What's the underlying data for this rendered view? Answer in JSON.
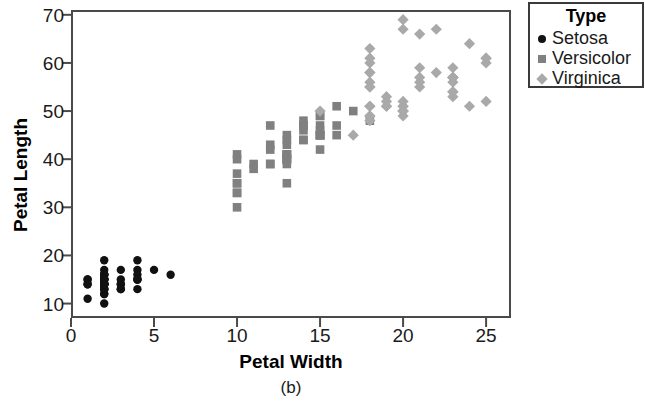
{
  "chart_data": {
    "type": "scatter",
    "title": "",
    "subcaption": "(b)",
    "xlabel": "Petal Width",
    "ylabel": "Petal Length",
    "xlim": [
      0,
      26.5
    ],
    "ylim": [
      7,
      71
    ],
    "xticks": [
      0,
      5,
      10,
      15,
      20,
      25
    ],
    "yticks": [
      10,
      20,
      30,
      40,
      50,
      60,
      70
    ],
    "grid": false,
    "legend": {
      "title": "Type",
      "position": "right-top",
      "entries": [
        {
          "name": "Setosa",
          "marker": "circle",
          "color": "#111111"
        },
        {
          "name": "Versicolor",
          "marker": "square",
          "color": "#808080"
        },
        {
          "name": "Virginica",
          "marker": "diamond",
          "color": "#a9a9a9"
        }
      ]
    },
    "series": [
      {
        "name": "Setosa",
        "marker": "circle",
        "color": "#111111",
        "points": [
          [
            2,
            14
          ],
          [
            2,
            14
          ],
          [
            2,
            13
          ],
          [
            2,
            15
          ],
          [
            2,
            14
          ],
          [
            4,
            17
          ],
          [
            3,
            14
          ],
          [
            2,
            15
          ],
          [
            2,
            14
          ],
          [
            1,
            15
          ],
          [
            2,
            15
          ],
          [
            2,
            16
          ],
          [
            1,
            14
          ],
          [
            1,
            11
          ],
          [
            2,
            12
          ],
          [
            4,
            15
          ],
          [
            4,
            13
          ],
          [
            3,
            14
          ],
          [
            3,
            17
          ],
          [
            3,
            15
          ],
          [
            2,
            17
          ],
          [
            4,
            15
          ],
          [
            2,
            10
          ],
          [
            5,
            17
          ],
          [
            2,
            19
          ],
          [
            2,
            16
          ],
          [
            4,
            16
          ],
          [
            2,
            15
          ],
          [
            2,
            14
          ],
          [
            2,
            16
          ],
          [
            2,
            16
          ],
          [
            4,
            15
          ],
          [
            1,
            15
          ],
          [
            2,
            14
          ],
          [
            2,
            15
          ],
          [
            2,
            12
          ],
          [
            2,
            13
          ],
          [
            1,
            14
          ],
          [
            2,
            13
          ],
          [
            2,
            15
          ],
          [
            3,
            13
          ],
          [
            3,
            13
          ],
          [
            2,
            13
          ],
          [
            6,
            16
          ],
          [
            4,
            19
          ],
          [
            2,
            14
          ],
          [
            2,
            16
          ],
          [
            2,
            14
          ],
          [
            2,
            15
          ],
          [
            2,
            14
          ]
        ]
      },
      {
        "name": "Versicolor",
        "marker": "square",
        "color": "#808080",
        "points": [
          [
            14,
            47
          ],
          [
            15,
            45
          ],
          [
            15,
            49
          ],
          [
            13,
            40
          ],
          [
            15,
            46
          ],
          [
            13,
            45
          ],
          [
            16,
            47
          ],
          [
            10,
            33
          ],
          [
            14,
            46
          ],
          [
            13,
            39
          ],
          [
            10,
            35
          ],
          [
            15,
            42
          ],
          [
            10,
            40
          ],
          [
            14,
            47
          ],
          [
            13,
            35
          ],
          [
            14,
            44
          ],
          [
            15,
            45
          ],
          [
            10,
            41
          ],
          [
            15,
            45
          ],
          [
            11,
            39
          ],
          [
            18,
            48
          ],
          [
            13,
            40
          ],
          [
            15,
            49
          ],
          [
            12,
            47
          ],
          [
            13,
            43
          ],
          [
            14,
            44
          ],
          [
            14,
            48
          ],
          [
            17,
            50
          ],
          [
            15,
            45
          ],
          [
            10,
            35
          ],
          [
            11,
            38
          ],
          [
            10,
            37
          ],
          [
            12,
            39
          ],
          [
            16,
            51
          ],
          [
            15,
            45
          ],
          [
            16,
            45
          ],
          [
            15,
            47
          ],
          [
            13,
            44
          ],
          [
            13,
            41
          ],
          [
            13,
            40
          ],
          [
            12,
            42
          ],
          [
            14,
            47
          ],
          [
            12,
            39
          ],
          [
            10,
            30
          ],
          [
            13,
            41
          ],
          [
            13,
            40
          ],
          [
            13,
            41
          ],
          [
            12,
            43
          ],
          [
            10,
            33
          ],
          [
            13,
            41
          ]
        ]
      },
      {
        "name": "Virginica",
        "marker": "diamond",
        "color": "#a9a9a9",
        "points": [
          [
            25,
            60
          ],
          [
            19,
            51
          ],
          [
            21,
            59
          ],
          [
            18,
            56
          ],
          [
            22,
            58
          ],
          [
            21,
            66
          ],
          [
            17,
            45
          ],
          [
            18,
            63
          ],
          [
            18,
            58
          ],
          [
            25,
            61
          ],
          [
            20,
            51
          ],
          [
            19,
            53
          ],
          [
            21,
            55
          ],
          [
            20,
            50
          ],
          [
            24,
            51
          ],
          [
            23,
            53
          ],
          [
            18,
            55
          ],
          [
            22,
            67
          ],
          [
            20,
            69
          ],
          [
            15,
            50
          ],
          [
            23,
            57
          ],
          [
            20,
            49
          ],
          [
            20,
            67
          ],
          [
            18,
            49
          ],
          [
            21,
            57
          ],
          [
            18,
            60
          ],
          [
            18,
            48
          ],
          [
            18,
            49
          ],
          [
            21,
            56
          ],
          [
            18,
            58
          ],
          [
            18,
            61
          ],
          [
            24,
            64
          ],
          [
            23,
            56
          ],
          [
            18,
            51
          ],
          [
            18,
            55
          ],
          [
            25,
            61
          ],
          [
            23,
            54
          ],
          [
            19,
            51
          ],
          [
            20,
            51
          ],
          [
            23,
            59
          ],
          [
            23,
            57
          ],
          [
            20,
            52
          ],
          [
            20,
            50
          ],
          [
            23,
            57
          ],
          [
            25,
            52
          ],
          [
            23,
            57
          ],
          [
            19,
            52
          ],
          [
            20,
            50
          ],
          [
            23,
            54
          ],
          [
            18,
            51
          ]
        ]
      }
    ]
  }
}
